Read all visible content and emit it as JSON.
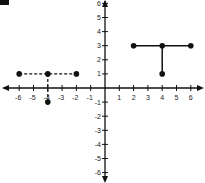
{
  "chart_data": {
    "type": "scatter",
    "title": "",
    "xlabel": "",
    "ylabel": "",
    "xlim": [
      -6,
      6
    ],
    "ylim": [
      -6,
      6
    ],
    "grid": false,
    "x_ticks": [
      -6,
      -5,
      -4,
      -3,
      -2,
      -1,
      1,
      2,
      3,
      4,
      5,
      6
    ],
    "y_ticks": [
      6,
      5,
      4,
      3,
      2,
      1,
      -1,
      -2,
      -3,
      -4,
      -5,
      -6
    ],
    "series": [
      {
        "name": "dashed-horizontal-segment",
        "style": "dashed",
        "points": [
          [
            -6,
            1
          ],
          [
            -4,
            1
          ],
          [
            -2,
            1
          ]
        ]
      },
      {
        "name": "dashed-vertical-segment",
        "style": "dashed",
        "points": [
          [
            -4,
            1
          ],
          [
            -4,
            -1
          ]
        ]
      },
      {
        "name": "solid-horizontal-segment",
        "style": "solid",
        "points": [
          [
            2,
            3
          ],
          [
            4,
            3
          ],
          [
            6,
            3
          ]
        ]
      },
      {
        "name": "solid-vertical-segment",
        "style": "solid",
        "points": [
          [
            4,
            3
          ],
          [
            4,
            1
          ]
        ]
      }
    ],
    "points": [
      [
        -6,
        1
      ],
      [
        -4,
        1
      ],
      [
        -2,
        1
      ],
      [
        -4,
        -1
      ],
      [
        2,
        3
      ],
      [
        4,
        3
      ],
      [
        6,
        3
      ],
      [
        4,
        1
      ]
    ]
  },
  "colors": {
    "ink": "#111111"
  }
}
